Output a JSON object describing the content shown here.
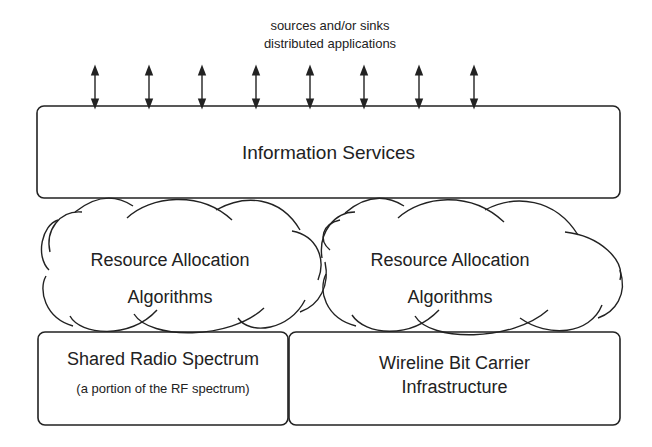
{
  "caption": {
    "line1": "sources and/or sinks",
    "line2": "distributed applications"
  },
  "arrows": {
    "count": 8,
    "type": "bidirectional"
  },
  "top_box": {
    "label": "Information Services"
  },
  "clouds": [
    {
      "line1": "Resource Allocation",
      "line2": "Algorithms"
    },
    {
      "line1": "Resource Allocation",
      "line2": "Algorithms"
    }
  ],
  "bottom_boxes": [
    {
      "label": "Shared Radio Spectrum",
      "sublabel": "(a portion of the RF spectrum)"
    },
    {
      "line1": "Wireline Bit Carrier",
      "line2": "Infrastructure"
    }
  ],
  "colors": {
    "stroke": "#222222",
    "background": "#ffffff"
  }
}
